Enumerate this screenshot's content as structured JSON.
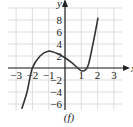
{
  "chart_data": {
    "type": "line",
    "title": "",
    "caption": "(f)",
    "xlabel": "x",
    "ylabel": "y",
    "xlim": [
      -3.5,
      3.5
    ],
    "ylim": [
      -7,
      10
    ],
    "grid": true,
    "x_ticks": [
      -3,
      -2,
      -1,
      1,
      2,
      3
    ],
    "x_tick_labels": [
      "−3",
      "−2",
      "−1",
      "1",
      "2",
      "3"
    ],
    "y_ticks": [
      -6,
      -4,
      -2,
      2,
      4,
      6,
      8
    ],
    "y_tick_labels": [
      "−6",
      "−4",
      "−2",
      "2",
      "4",
      "6",
      "8"
    ],
    "series": [
      {
        "name": "f",
        "x": [
          -2.64,
          -2.33,
          -2.0,
          -1.53,
          -1.04,
          -0.55,
          0.0,
          0.5,
          1.04,
          1.4,
          1.7,
          2.02
        ],
        "y": [
          -6.7,
          -4.0,
          0.0,
          2.0,
          2.8,
          2.5,
          1.7,
          0.7,
          -0.5,
          0.3,
          3.8,
          8.3
        ]
      }
    ]
  }
}
